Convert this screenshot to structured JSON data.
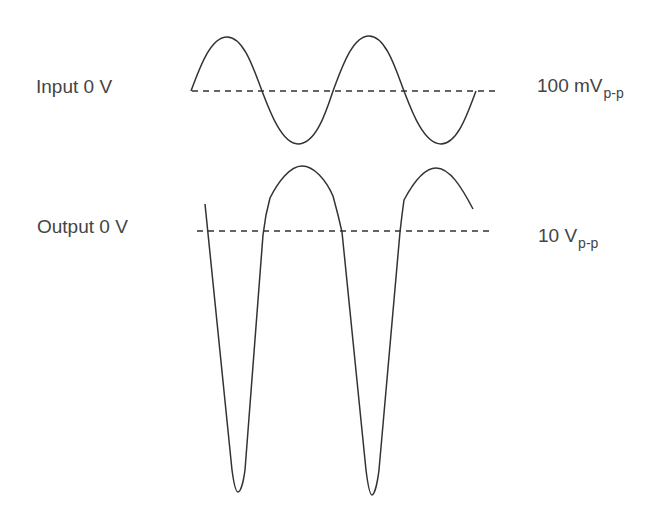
{
  "diagram": {
    "input": {
      "left_label": "Input 0 V",
      "right_label_main": "100 mV",
      "right_label_sub": "p-p",
      "waveform": "sine",
      "baseline_y": 91
    },
    "output": {
      "left_label": "Output 0 V",
      "right_label_main": "10 V",
      "right_label_sub": "p-p",
      "waveform": "distorted-amplified-sine",
      "baseline_y": 231
    },
    "colors": {
      "text": "#444444",
      "line": "#333333",
      "background": "#ffffff"
    }
  }
}
